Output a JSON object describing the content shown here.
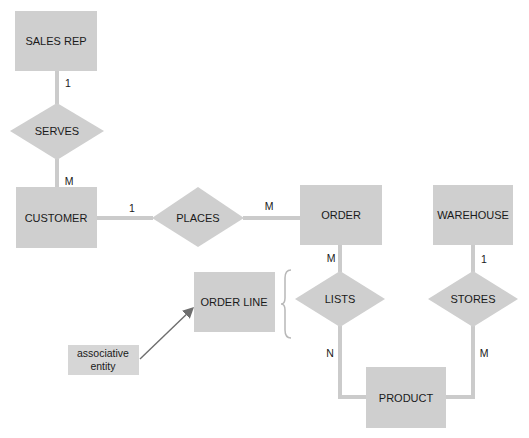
{
  "diagram": {
    "type": "entity-relationship",
    "colors": {
      "shape_fill": "#cfcfcf",
      "connector": "#cbcbcb",
      "arrow": "#6e6e6e",
      "text": "#1a1a1a",
      "background": "#ffffff"
    },
    "entities": [
      {
        "id": "sales_rep",
        "label": "SALES REP"
      },
      {
        "id": "customer",
        "label": "CUSTOMER"
      },
      {
        "id": "order",
        "label": "ORDER"
      },
      {
        "id": "warehouse",
        "label": "WAREHOUSE"
      },
      {
        "id": "order_line",
        "label": "ORDER LINE"
      },
      {
        "id": "product",
        "label": "PRODUCT"
      }
    ],
    "relationships": [
      {
        "id": "serves",
        "label": "SERVES"
      },
      {
        "id": "places",
        "label": "PLACES"
      },
      {
        "id": "lists",
        "label": "LISTS"
      },
      {
        "id": "stores",
        "label": "STORES"
      }
    ],
    "cardinalities": {
      "sales_rep_serves": "1",
      "serves_customer": "M",
      "customer_places": "1",
      "places_order": "M",
      "order_lists": "M",
      "lists_product": "N",
      "warehouse_stores": "1",
      "stores_product": "M"
    },
    "annotation": {
      "line1": "associative",
      "line2": "entity",
      "points_to": "ORDER LINE"
    }
  }
}
